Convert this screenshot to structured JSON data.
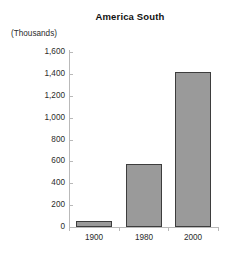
{
  "chart_data": {
    "type": "bar",
    "title": "America South",
    "subtitle": "",
    "units_caption": "(Thousands)",
    "xlabel": "",
    "ylabel": "",
    "categories": [
      "1900",
      "1980",
      "2000"
    ],
    "values": [
      55,
      575,
      1420
    ],
    "series": [
      {
        "name": "America South",
        "values": [
          55,
          575,
          1420
        ]
      }
    ],
    "ylim": [
      0,
      1600
    ],
    "ytick_values": [
      0,
      200,
      400,
      600,
      800,
      1000,
      1200,
      1400,
      1600
    ],
    "ytick_labels": [
      "0",
      "200",
      "400",
      "600",
      "800",
      "1,000",
      "1,200",
      "1,400",
      "1,600"
    ],
    "grid": false,
    "legend": "none",
    "bar_fill_color": "#9a9a9a",
    "bar_border_color": "#3d3d3d",
    "axis_color": "#b9b9b9",
    "background_color": "#ffffff",
    "text_color": "#2b2b2b"
  }
}
